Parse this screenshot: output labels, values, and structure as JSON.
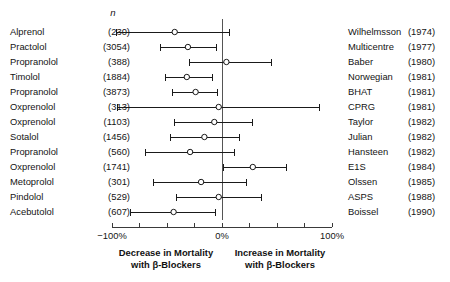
{
  "headers": {
    "n_header": "n"
  },
  "axis": {
    "left_label": "−100%",
    "center_label": "0%",
    "right_label": "100%",
    "min": -100,
    "max": 100,
    "ticks": [
      -100,
      -75,
      -50,
      -25,
      0,
      25,
      50,
      75,
      100
    ]
  },
  "captions": {
    "left_line1": "Decrease in Mortality",
    "left_line2": "with β-Blockers",
    "right_line1": "Increase in Mortality",
    "right_line2": "with β-Blockers"
  },
  "colors": {
    "line": "#1a1a1a",
    "marker_fill": "#ffffff",
    "axis": "#3a3a3a",
    "reference": "#555555",
    "text": "#141414"
  },
  "chart_data": {
    "type": "scatter",
    "title": "",
    "xlabel": "Percent change in mortality with β-Blockers",
    "ylabel": "",
    "xlim": [
      -100,
      100
    ],
    "grid": false,
    "legend": "none",
    "reference_line": 0,
    "columns": [
      "Drug",
      "n",
      "Study",
      "Year",
      "Estimate",
      "CI low",
      "CI high"
    ],
    "rows": [
      {
        "drug": "Alprenol",
        "n": "(230)",
        "n_value": 230,
        "study": "Wilhelmsson",
        "year": "(1974)",
        "estimate": -43,
        "ci_low": -96,
        "ci_high": 7
      },
      {
        "drug": "Practolol",
        "n": "(3054)",
        "n_value": 3054,
        "study": "Multicentre",
        "year": "(1977)",
        "estimate": -31,
        "ci_low": -56,
        "ci_high": -5
      },
      {
        "drug": "Propranolol",
        "n": "(388)",
        "n_value": 388,
        "study": "Baber",
        "year": "(1980)",
        "estimate": 4,
        "ci_low": -30,
        "ci_high": 45
      },
      {
        "drug": "Timolol",
        "n": "(1884)",
        "n_value": 1884,
        "study": "Norwegian",
        "year": "(1981)",
        "estimate": -32,
        "ci_low": -51,
        "ci_high": -9
      },
      {
        "drug": "Propranolol",
        "n": "(3873)",
        "n_value": 3873,
        "study": "BHAT",
        "year": "(1981)",
        "estimate": -24,
        "ci_low": -45,
        "ci_high": -4
      },
      {
        "drug": "Oxprenolol",
        "n": "(313)",
        "n_value": 313,
        "study": "CPRG",
        "year": "(1981)",
        "estimate": -3,
        "ci_low": -95,
        "ci_high": 89
      },
      {
        "drug": "Oxprenolol",
        "n": "(1103)",
        "n_value": 1103,
        "study": "Taylor",
        "year": "(1982)",
        "estimate": -7,
        "ci_low": -43,
        "ci_high": 28
      },
      {
        "drug": "Sotalol",
        "n": "(1456)",
        "n_value": 1456,
        "study": "Julian",
        "year": "(1982)",
        "estimate": -16,
        "ci_low": -47,
        "ci_high": 16
      },
      {
        "drug": "Propranolol",
        "n": "(560)",
        "n_value": 560,
        "study": "Hansteen",
        "year": "(1982)",
        "estimate": -29,
        "ci_low": -70,
        "ci_high": 11
      },
      {
        "drug": "Oxprenolol",
        "n": "(1741)",
        "n_value": 1741,
        "study": "E1S",
        "year": "(1984)",
        "estimate": 28,
        "ci_low": 1,
        "ci_high": 59
      },
      {
        "drug": "Metoprolol",
        "n": "(301)",
        "n_value": 301,
        "study": "Olssen",
        "year": "(1985)",
        "estimate": -19,
        "ci_low": -62,
        "ci_high": 22
      },
      {
        "drug": "Pindolol",
        "n": "(529)",
        "n_value": 529,
        "study": "ASPS",
        "year": "(1988)",
        "estimate": -3,
        "ci_low": -41,
        "ci_high": 36
      },
      {
        "drug": "Acebutolol",
        "n": "(607)",
        "n_value": 607,
        "study": "Boissel",
        "year": "(1990)",
        "estimate": -44,
        "ci_low": -83,
        "ci_high": -6
      }
    ]
  }
}
